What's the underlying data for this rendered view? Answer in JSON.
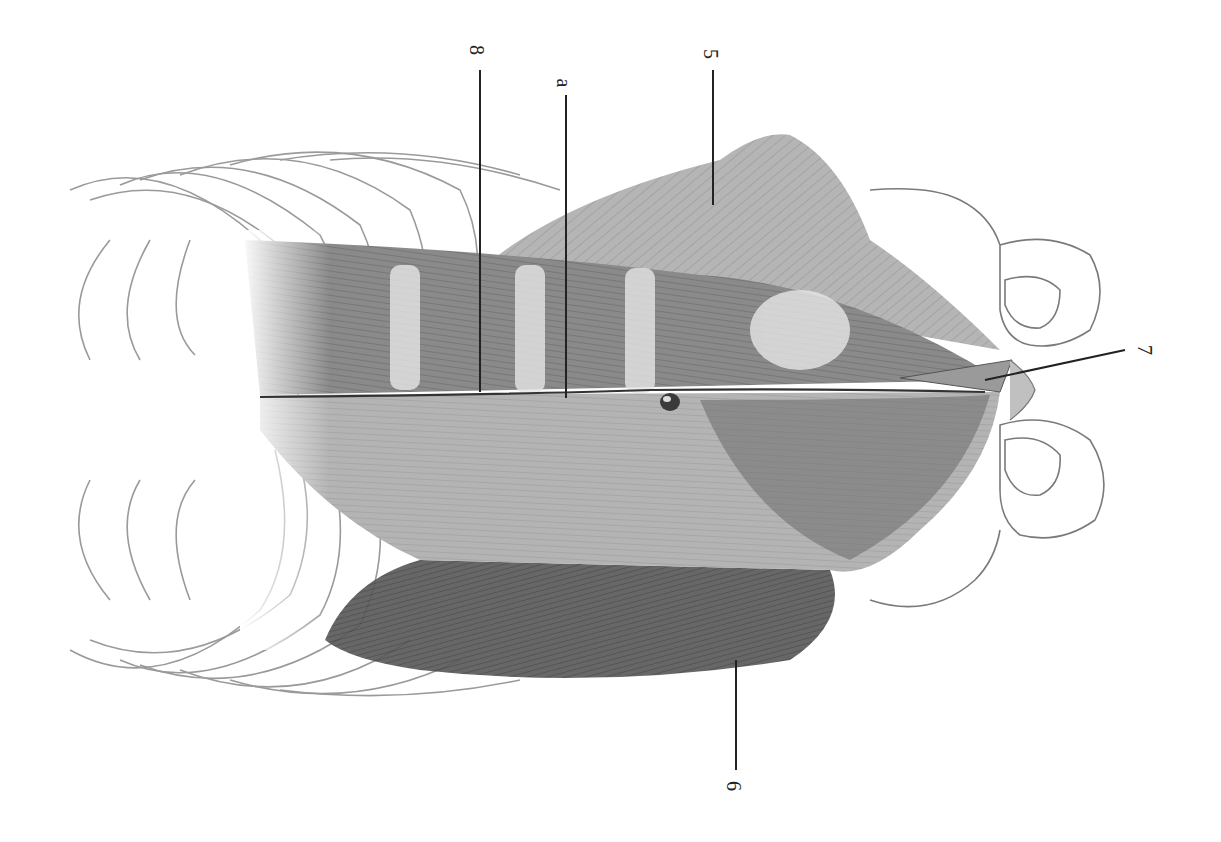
{
  "figure": {
    "orientation": "rotated 90 degrees clockwise; thorax left, pelvis right",
    "colors": {
      "background": "#ffffff",
      "ink": "#222222",
      "muscle_dark": "#4a4a4a",
      "muscle_mid": "#8c8c8c",
      "muscle_light": "#c8c8c8",
      "bone_outline": "#7a7a7a"
    }
  },
  "labels": [
    {
      "id": "8",
      "text": "8",
      "x": 480,
      "y": 50
    },
    {
      "id": "a",
      "text": "a",
      "x": 566,
      "y": 82
    },
    {
      "id": "5",
      "text": "5",
      "x": 713,
      "y": 54
    },
    {
      "id": "7",
      "text": "7",
      "x": 1148,
      "y": 350
    },
    {
      "id": "6",
      "text": "6",
      "x": 736,
      "y": 786
    }
  ],
  "structures": [
    {
      "name": "rib cage",
      "region": "left"
    },
    {
      "name": "rectus abdominis",
      "label": "8"
    },
    {
      "name": "linea alba",
      "label": "a"
    },
    {
      "name": "umbilicus",
      "region": "center"
    },
    {
      "name": "external oblique (upper)",
      "label": "5"
    },
    {
      "name": "external oblique (lower)",
      "label": "6"
    },
    {
      "name": "pyramidalis",
      "label": "7"
    },
    {
      "name": "pelvis",
      "region": "right"
    }
  ]
}
